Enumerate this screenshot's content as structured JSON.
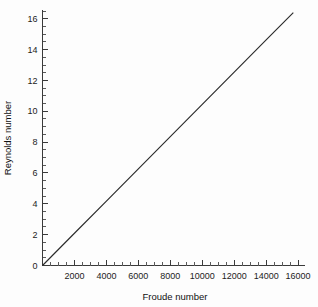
{
  "chart_data": {
    "type": "line",
    "title": "",
    "subtitle": "",
    "xlabel": "Froude number",
    "ylabel": "Reynolds number",
    "xlim": [
      0,
      16400
    ],
    "ylim": [
      0,
      16.6
    ],
    "grid": false,
    "legend": false,
    "legend_position": "none",
    "x_major_ticks": [
      0,
      2000,
      4000,
      6000,
      8000,
      10000,
      12000,
      14000,
      16000
    ],
    "x_tick_labels": [
      "",
      "2000",
      "4000",
      "6000",
      "8000",
      "10000",
      "12000",
      "14000",
      "16000"
    ],
    "x_minor_interval": 500,
    "y_major_ticks": [
      0,
      2,
      4,
      6,
      8,
      10,
      12,
      14,
      16
    ],
    "y_tick_labels": [
      "0",
      "2",
      "4",
      "6",
      "8",
      "10",
      "12",
      "14",
      "16"
    ],
    "y_minor_interval": 0.5,
    "series": [
      {
        "name": "Reynolds vs Froude",
        "color": "#2b2b2b",
        "x": [
          0,
          2000,
          4000,
          6000,
          8000,
          10000,
          12000,
          14000,
          15700
        ],
        "values": [
          0,
          2.09,
          4.18,
          6.27,
          8.36,
          10.45,
          12.54,
          14.63,
          16.4
        ]
      }
    ]
  },
  "axes": {
    "x_title": "Froude number",
    "y_title": "Reynolds number"
  },
  "colors": {
    "background": "#fdfdfd",
    "axis": "#3a3a3a",
    "line": "#2b2b2b",
    "text": "#1c1c1c"
  }
}
